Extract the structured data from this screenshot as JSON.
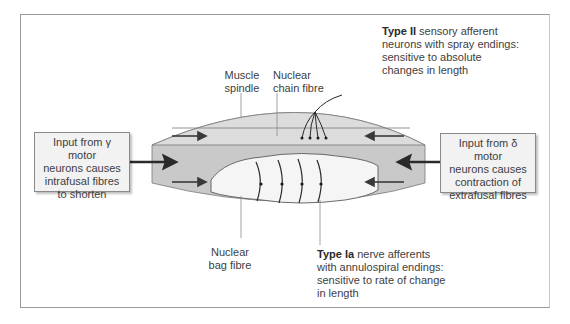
{
  "diagram": {
    "colors": {
      "outer_capsule": "#c9c9c9",
      "chain_region": "#dcdcdc",
      "bag_fibre": "#f5f5f5",
      "lines": "#3a3a3a",
      "arrows": "#3a3a3a",
      "box_fill": "#f2f2f2",
      "frame": "#9a9a9a"
    },
    "labels": {
      "muscle_spindle": "Muscle spindle",
      "muscle_spindle_line1": "Muscle",
      "muscle_spindle_line2": "spindle",
      "nuclear_chain_line1": "Nuclear",
      "nuclear_chain_line2": "chain fibre",
      "nuclear_bag_line1": "Nuclear",
      "nuclear_bag_line2": "bag fibre"
    },
    "type_ii": {
      "bold": "Type II",
      "line1_rest": " sensory afferent",
      "line2": "neurons with spray endings:",
      "line3": "sensitive to absolute",
      "line4": "changes in length"
    },
    "type_ia": {
      "bold": "Type Ia",
      "line1_rest": " nerve afferents",
      "line2": "with annulospiral endings:",
      "line3": "sensitive to rate of change",
      "line4": "in length"
    },
    "left_box": {
      "line1": "Input from γ motor",
      "line2": "neurons causes",
      "line3": "intrafusal fibres",
      "line4": "to shorten"
    },
    "right_box": {
      "line1": "Input from δ motor",
      "line2": "neurons causes",
      "line3": "contraction of",
      "line4": "extrafusal fibres"
    },
    "icons": {
      "left_input_arrow": "arrow-right",
      "right_input_arrow": "arrow-left",
      "inner_arrows": [
        "arrow-right",
        "arrow-right",
        "arrow-left",
        "arrow-left"
      ]
    }
  }
}
